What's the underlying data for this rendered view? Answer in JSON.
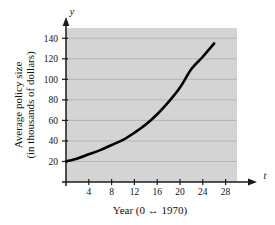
{
  "chart_data": {
    "type": "line",
    "title": "",
    "xlabel": "Year (0 ↔ 1970)",
    "ylabel_line1": "Average policy size",
    "ylabel_line2": "(in thousands of dollars)",
    "x_axis_symbol": "t",
    "y_axis_symbol": "y",
    "xlim": [
      0,
      30
    ],
    "ylim": [
      0,
      150
    ],
    "xticks": [
      4,
      8,
      12,
      16,
      20,
      24,
      28
    ],
    "xtick_labels": [
      "4",
      "8",
      "12",
      "16",
      "20",
      "24",
      "28"
    ],
    "yticks": [
      20,
      40,
      60,
      80,
      100,
      120,
      140
    ],
    "ytick_labels": [
      "20",
      "40",
      "60",
      "80",
      "100",
      "120",
      "140"
    ],
    "grid": "horizontal",
    "legend": "none",
    "plot_background": "#d4d4d4",
    "curve_color": "#000000",
    "x": [
      0,
      2,
      4,
      6,
      8,
      10,
      12,
      14,
      16,
      18,
      20,
      22,
      24,
      26
    ],
    "values": [
      20,
      23,
      27,
      31,
      36,
      41,
      48,
      56,
      66,
      78,
      92,
      110,
      122,
      135
    ],
    "series": [
      {
        "name": "Average policy size",
        "values": [
          20,
          23,
          27,
          31,
          36,
          41,
          48,
          56,
          66,
          78,
          92,
          110,
          122,
          135
        ]
      }
    ]
  }
}
